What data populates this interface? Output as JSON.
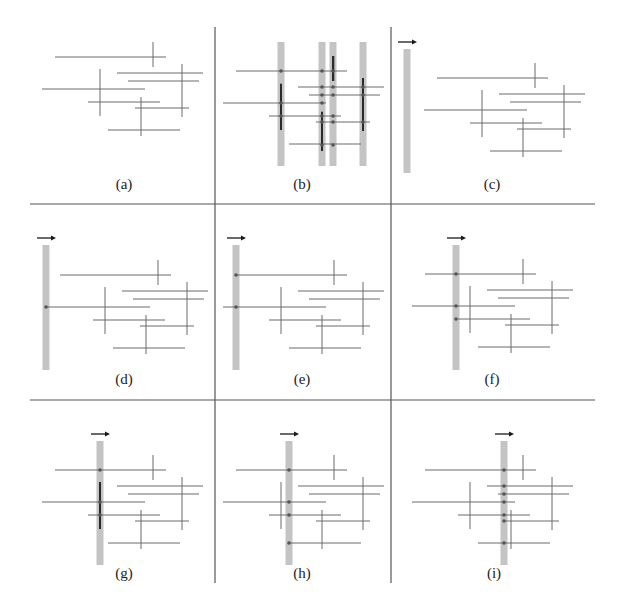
{
  "figure": {
    "colors": {
      "segment": "#6a6a6a",
      "grid": "#555555",
      "sweep_bar": "#c4c4c4",
      "active_interval": "#2a2a2a",
      "event_dot": "#555555",
      "arrow": "#1a1a1a",
      "label": "#222222"
    },
    "grid_lines": {
      "vertical": [
        {
          "x": 215,
          "y1": 27,
          "y2": 583
        },
        {
          "x": 391,
          "y1": 27,
          "y2": 583
        }
      ],
      "horizontal": [
        {
          "y": 204,
          "x1": 30,
          "x2": 595
        },
        {
          "y": 400,
          "x1": 30,
          "x2": 595
        }
      ]
    },
    "segments_local": {
      "note": "coordinates relative to panel's first horizontal segment start",
      "horizontal": [
        {
          "x1": 0,
          "x2": 111,
          "y": 0
        },
        {
          "x1": 62,
          "x2": 148,
          "y": 16
        },
        {
          "x1": 73,
          "x2": 144,
          "y": 24
        },
        {
          "x1": -13,
          "x2": 90,
          "y": 32
        },
        {
          "x1": 33,
          "x2": 105,
          "y": 45
        },
        {
          "x1": 80,
          "x2": 134,
          "y": 51
        },
        {
          "x1": 53,
          "x2": 125,
          "y": 73
        }
      ],
      "vertical": [
        {
          "x": 98,
          "y1": -15,
          "y2": 10
        },
        {
          "x": 127,
          "y1": 7,
          "y2": 60
        },
        {
          "x": 45,
          "y1": 12,
          "y2": 59
        },
        {
          "x": 86,
          "y1": 40,
          "y2": 79
        }
      ]
    },
    "panels": [
      {
        "id": "a",
        "label": "(a)",
        "origin": [
          55,
          57
        ],
        "label_pos": [
          124,
          186
        ],
        "bars": [],
        "arrow": false,
        "dots": [],
        "active": []
      },
      {
        "id": "b",
        "label": "(b)",
        "origin": [
          236,
          71
        ],
        "label_pos": [
          302,
          186
        ],
        "bars": [
          {
            "x": 281,
            "y1": 42,
            "y2": 166
          },
          {
            "x": 322,
            "y1": 42,
            "y2": 166
          },
          {
            "x": 333,
            "y1": 42,
            "y2": 166
          },
          {
            "x": 363,
            "y1": 42,
            "y2": 166
          }
        ],
        "arrow": false,
        "dots": [
          [
            281,
            71
          ],
          [
            322,
            71
          ],
          [
            333,
            71
          ],
          [
            322,
            87
          ],
          [
            333,
            87
          ],
          [
            322,
            95
          ],
          [
            333,
            95
          ],
          [
            322,
            103
          ],
          [
            281,
            103
          ],
          [
            281,
            116
          ],
          [
            322,
            116
          ],
          [
            333,
            116
          ],
          [
            322,
            122
          ],
          [
            333,
            122
          ],
          [
            363,
            87
          ],
          [
            363,
            95
          ],
          [
            363,
            122
          ],
          [
            322,
            145
          ],
          [
            333,
            145
          ]
        ],
        "active": [
          {
            "x": 281,
            "y1": 84,
            "y2": 130
          },
          {
            "x": 333,
            "y1": 56,
            "y2": 81
          },
          {
            "x": 363,
            "y1": 78,
            "y2": 131
          },
          {
            "x": 322,
            "y1": 112,
            "y2": 151
          }
        ]
      },
      {
        "id": "c",
        "label": "(c)",
        "origin": [
          437,
          78
        ],
        "label_pos": [
          492,
          186
        ],
        "bars": [
          {
            "x": 407,
            "y1": 49,
            "y2": 173
          }
        ],
        "arrow": true,
        "dots": [],
        "active": []
      },
      {
        "id": "d",
        "label": "(d)",
        "origin": [
          60,
          275
        ],
        "label_pos": [
          124,
          381
        ],
        "bars": [
          {
            "x": 46,
            "y1": 245,
            "y2": 370
          }
        ],
        "arrow": true,
        "dots": [
          [
            46,
            307
          ]
        ],
        "active": []
      },
      {
        "id": "e",
        "label": "(e)",
        "origin": [
          236,
          275
        ],
        "label_pos": [
          302,
          381
        ],
        "bars": [
          {
            "x": 236,
            "y1": 245,
            "y2": 370
          }
        ],
        "arrow": true,
        "dots": [
          [
            236,
            275
          ],
          [
            236,
            307
          ]
        ],
        "active": []
      },
      {
        "id": "f",
        "label": "(f)",
        "origin": [
          425,
          274
        ],
        "label_pos": [
          492,
          381
        ],
        "bars": [
          {
            "x": 456,
            "y1": 245,
            "y2": 370
          }
        ],
        "arrow": true,
        "dots": [
          [
            456,
            274
          ],
          [
            456,
            306
          ],
          [
            456,
            319
          ]
        ],
        "active": []
      },
      {
        "id": "g",
        "label": "(g)",
        "origin": [
          55,
          470
        ],
        "label_pos": [
          124,
          575
        ],
        "bars": [
          {
            "x": 100,
            "y1": 441,
            "y2": 565
          }
        ],
        "arrow": true,
        "dots": [
          [
            100,
            470
          ],
          [
            100,
            502
          ],
          [
            100,
            515
          ]
        ],
        "active": [
          {
            "x": 100,
            "y1": 482,
            "y2": 529
          }
        ]
      },
      {
        "id": "h",
        "label": "(h)",
        "origin": [
          236,
          470
        ],
        "label_pos": [
          302,
          575
        ],
        "bars": [
          {
            "x": 289,
            "y1": 441,
            "y2": 565
          }
        ],
        "arrow": true,
        "dots": [
          [
            289,
            470
          ],
          [
            289,
            502
          ],
          [
            289,
            515
          ],
          [
            289,
            543
          ]
        ],
        "active": []
      },
      {
        "id": "i",
        "label": "(i)",
        "origin": [
          425,
          470
        ],
        "label_pos": [
          494,
          575
        ],
        "bars": [
          {
            "x": 504,
            "y1": 441,
            "y2": 565
          }
        ],
        "arrow": true,
        "dots": [
          [
            504,
            470
          ],
          [
            504,
            486
          ],
          [
            504,
            494
          ],
          [
            504,
            502
          ],
          [
            504,
            515
          ],
          [
            504,
            521
          ],
          [
            504,
            543
          ]
        ],
        "active": []
      }
    ]
  }
}
